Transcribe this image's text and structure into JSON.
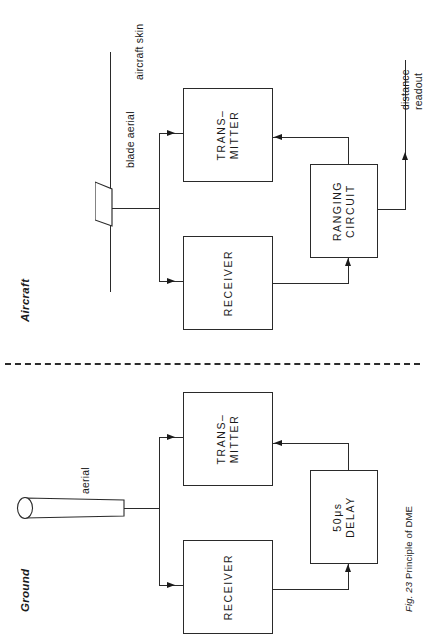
{
  "figure": {
    "caption_prefix": "Fig. 23",
    "caption_text": "Principle of DME",
    "caption_full": "Fig. 23 Principle of DME"
  },
  "sections": {
    "aircraft": {
      "label": "Aircraft",
      "blocks": [
        {
          "id": "transmitter",
          "line1": "TRANS–",
          "line2": "MITTER"
        },
        {
          "id": "receiver",
          "line1": "RECEIVER",
          "line2": ""
        },
        {
          "id": "ranging-circuit",
          "line1": "RANGING",
          "line2": "CIRCUIT"
        }
      ],
      "callouts": [
        {
          "id": "aircraft-skin",
          "text": "aircraft skin"
        },
        {
          "id": "blade-aerial",
          "text": "blade aerial"
        },
        {
          "id": "distance-readout-1",
          "text": "distance"
        },
        {
          "id": "distance-readout-2",
          "text": "readout"
        }
      ]
    },
    "ground": {
      "label": "Ground",
      "blocks": [
        {
          "id": "transmitter",
          "line1": "TRANS–",
          "line2": "MITTER"
        },
        {
          "id": "receiver",
          "line1": "RECEIVER",
          "line2": ""
        },
        {
          "id": "delay",
          "line1": "50μs",
          "line2": "DELAY"
        }
      ],
      "callouts": [
        {
          "id": "aerial",
          "text": "aerial"
        }
      ]
    }
  },
  "colors": {
    "ink": "#1a1a1a",
    "line": "#2a2a2a",
    "paper": "#ffffff"
  }
}
